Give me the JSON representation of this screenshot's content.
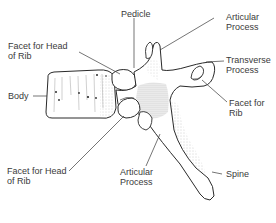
{
  "diagram": {
    "labels": {
      "pedicle": "Pedicle",
      "articular_process_top_1": "Articular",
      "articular_process_top_2": "Process",
      "transverse_process_1": "Transverse",
      "transverse_process_2": "Process",
      "facet_for_rib_1": "Facet for",
      "facet_for_rib_2": "Rib",
      "facet_head_rib_top_1": "Facet for Head",
      "facet_head_rib_top_2": "of Rib",
      "body": "Body",
      "facet_head_rib_bottom_1": "Facet for Head",
      "facet_head_rib_bottom_2": "of Rib",
      "articular_process_bottom_1": "Articular",
      "articular_process_bottom_2": "Process",
      "spine": "Spine"
    },
    "colors": {
      "ink": "#2a2a2a",
      "shade": "#9a9a9a",
      "background": "#ffffff"
    }
  }
}
